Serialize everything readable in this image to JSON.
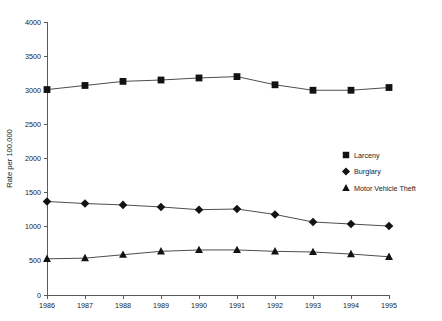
{
  "chart_data": {
    "type": "line",
    "title": "",
    "subtitle": "",
    "xlabel": "",
    "ylabel": "Rate per 100,000",
    "categories": [
      "1986",
      "1987",
      "1988",
      "1989",
      "1990",
      "1991",
      "1992",
      "1993",
      "1994",
      "1995"
    ],
    "x": [
      1986,
      1987,
      1988,
      1989,
      1990,
      1991,
      1992,
      1993,
      1994,
      1995
    ],
    "xlim": [
      1986,
      1995
    ],
    "ylim": [
      0,
      4000
    ],
    "ytick_labels": [
      "0",
      "500",
      "1000",
      "1500",
      "2000",
      "2500",
      "3000",
      "3500",
      "4000"
    ],
    "yticks": [
      0,
      500,
      1000,
      1500,
      2000,
      2500,
      3000,
      3500,
      4000
    ],
    "grid": false,
    "legend_position": "center-right",
    "series": [
      {
        "name": "Larceny",
        "marker": "square",
        "values": [
          3010,
          3070,
          3130,
          3150,
          3180,
          3200,
          3080,
          3000,
          3000,
          3040
        ]
      },
      {
        "name": "Burglary",
        "marker": "diamond",
        "values": [
          1370,
          1340,
          1320,
          1290,
          1250,
          1260,
          1180,
          1070,
          1040,
          1010
        ]
      },
      {
        "name": "Motor Vehicle Theft",
        "marker": "triangle",
        "values": [
          530,
          540,
          590,
          640,
          660,
          660,
          640,
          630,
          600,
          560
        ]
      }
    ]
  },
  "colors": {
    "marker": "#121212",
    "line": "#4d4d4d",
    "axis": "#5a5a5a",
    "text": "#1a1a1a",
    "background": "#ffffff"
  },
  "legend": {
    "items": [
      {
        "label": "Larceny",
        "marker": "square"
      },
      {
        "label": "Burglary",
        "marker": "diamond"
      },
      {
        "label": "Motor Vehicle Theft",
        "marker": "triangle"
      }
    ]
  }
}
